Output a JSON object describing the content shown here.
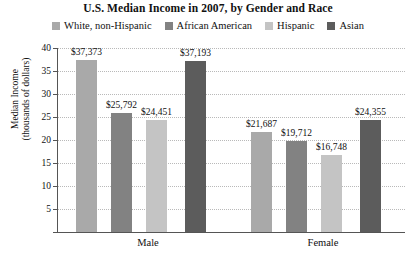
{
  "chart_data": {
    "type": "bar",
    "title": "U.S. Median Income in 2007, by Gender and Race",
    "xlabel": "",
    "ylabel": "Median Income\n(thousands of dollars)",
    "ylabel_line1": "Median Income",
    "ylabel_line2": "(thousands of dollars)",
    "categories": [
      "Male",
      "Female"
    ],
    "ylim": [
      0,
      40
    ],
    "yticks": [
      0,
      5,
      10,
      15,
      20,
      25,
      30,
      35,
      40
    ],
    "ytick_labels": [
      "",
      "5",
      "10",
      "15",
      "20",
      "25",
      "30",
      "35",
      "40"
    ],
    "grid": true,
    "legend_position": "top",
    "value_unit": "dollars",
    "series": [
      {
        "name": "White, non-Hispanic",
        "color": "#a9a9a9",
        "values": [
          37373,
          25792
        ],
        "labels": [
          "$37,373",
          "$21,687"
        ]
      },
      {
        "name": "African American",
        "color": "#828282",
        "values": [
          25792,
          19712
        ],
        "labels": [
          "$25,792",
          "$19,712"
        ]
      },
      {
        "name": "Hispanic",
        "color": "#c4c4c4",
        "values": [
          24451,
          16748
        ],
        "labels": [
          "$24,451",
          "$16,748"
        ]
      },
      {
        "name": "Asian",
        "color": "#5c5c5c",
        "values": [
          37193,
          24355
        ],
        "labels": [
          "$37,193",
          "$24,355"
        ]
      }
    ],
    "bars": [
      {
        "group": "Male",
        "series": "White, non-Hispanic",
        "value": 37.373,
        "label": "$37,373",
        "color": "#a9a9a9"
      },
      {
        "group": "Male",
        "series": "African American",
        "value": 25.792,
        "label": "$25,792",
        "color": "#828282"
      },
      {
        "group": "Male",
        "series": "Hispanic",
        "value": 24.451,
        "label": "$24,451",
        "color": "#c4c4c4"
      },
      {
        "group": "Male",
        "series": "Asian",
        "value": 37.193,
        "label": "$37,193",
        "color": "#5c5c5c"
      },
      {
        "group": "Female",
        "series": "White, non-Hispanic",
        "value": 21.687,
        "label": "$21,687",
        "color": "#a9a9a9"
      },
      {
        "group": "Female",
        "series": "African American",
        "value": 19.712,
        "label": "$19,712",
        "color": "#828282"
      },
      {
        "group": "Female",
        "series": "Hispanic",
        "value": 16.748,
        "label": "$16,748",
        "color": "#c4c4c4"
      },
      {
        "group": "Female",
        "series": "Asian",
        "value": 24.355,
        "label": "$24,355",
        "color": "#5c5c5c"
      }
    ]
  },
  "legend": {
    "items": [
      {
        "label": "White, non-Hispanic",
        "color": "#a9a9a9"
      },
      {
        "label": "African American",
        "color": "#828282"
      },
      {
        "label": "Hispanic",
        "color": "#c4c4c4"
      },
      {
        "label": "Asian",
        "color": "#5c5c5c"
      }
    ]
  },
  "axis": {
    "y_title_line1": "Median Income",
    "y_title_line2": "(thousands of dollars)",
    "y_ticks": [
      "40",
      "35",
      "30",
      "25",
      "20",
      "15",
      "10",
      "5",
      ""
    ]
  },
  "groups": [
    {
      "label": "Male"
    },
    {
      "label": "Female"
    }
  ]
}
